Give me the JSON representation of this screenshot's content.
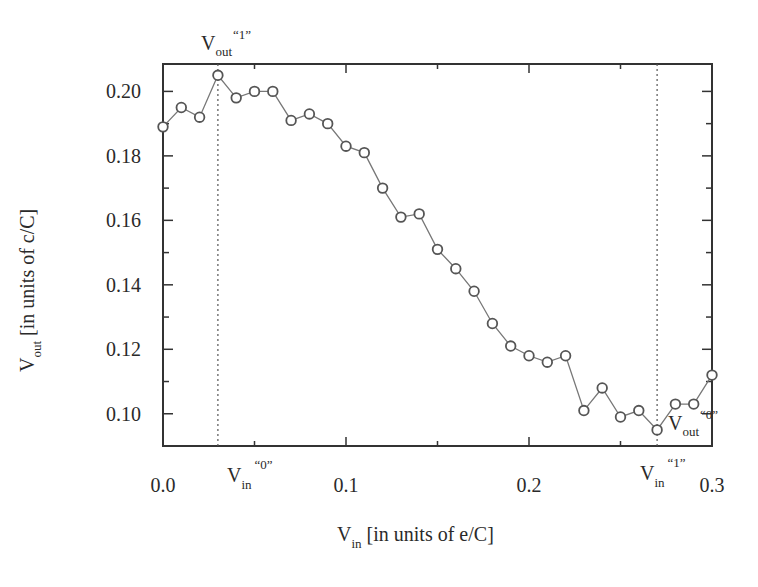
{
  "chart_data": {
    "type": "line",
    "title": "",
    "xlabel": "V_in [in units of e/C]",
    "ylabel": "V_out [in units of c/C]",
    "xlabel_parts": {
      "main": "V",
      "sub": "in",
      "rest": " [in units of e/C]"
    },
    "ylabel_parts": {
      "main": "V",
      "sub": "out",
      "rest": " [in units of c/C]"
    },
    "xlim": [
      0.0,
      0.3
    ],
    "ylim": [
      0.09,
      0.2085
    ],
    "x_ticks": [
      0.0,
      0.1,
      0.2,
      0.3
    ],
    "x_tick_labels": [
      "0.0",
      "0.1",
      "0.2",
      "0.3"
    ],
    "x_minor_ticks": [
      0.05,
      0.15,
      0.25
    ],
    "y_ticks": [
      0.1,
      0.12,
      0.14,
      0.16,
      0.18,
      0.2
    ],
    "y_tick_labels": [
      "0.10",
      "0.12",
      "0.14",
      "0.16",
      "0.18",
      "0.20"
    ],
    "y_minor_ticks": [
      0.11,
      0.13,
      0.15,
      0.17,
      0.19
    ],
    "grid": false,
    "legend": null,
    "marker": "open-circle",
    "line_color": "#777777",
    "marker_color": "#555555",
    "series": [
      {
        "name": "V_out vs V_in",
        "x": [
          0.0,
          0.01,
          0.02,
          0.03,
          0.04,
          0.05,
          0.06,
          0.07,
          0.08,
          0.09,
          0.1,
          0.11,
          0.12,
          0.13,
          0.14,
          0.15,
          0.16,
          0.17,
          0.18,
          0.19,
          0.2,
          0.21,
          0.22,
          0.23,
          0.24,
          0.25,
          0.26,
          0.27,
          0.28,
          0.29,
          0.3
        ],
        "values": [
          0.189,
          0.195,
          0.192,
          0.205,
          0.198,
          0.2,
          0.2,
          0.191,
          0.193,
          0.19,
          0.183,
          0.181,
          0.17,
          0.161,
          0.162,
          0.151,
          0.145,
          0.138,
          0.128,
          0.121,
          0.118,
          0.116,
          0.118,
          0.101,
          0.108,
          0.099,
          0.101,
          0.095,
          0.103,
          0.103,
          0.112
        ]
      }
    ],
    "reference_lines": [
      {
        "orientation": "vertical",
        "x": 0.03,
        "style": "dotted"
      },
      {
        "orientation": "vertical",
        "x": 0.27,
        "style": "dotted"
      }
    ],
    "annotations": [
      {
        "id": "vout1",
        "main": "V",
        "sub": "out",
        "sup": "“1”",
        "position": "above plot at x=0.03"
      },
      {
        "id": "vin0",
        "main": "V",
        "sub": "in",
        "sup": "“0”",
        "position": "below x-axis at x=0.03"
      },
      {
        "id": "vin1",
        "main": "V",
        "sub": "in",
        "sup": "“1”",
        "position": "below x-axis at x=0.27"
      },
      {
        "id": "vout0",
        "main": "V",
        "sub": "out",
        "sup": "“0”",
        "position": "inside plot near (0.27, 0.095)"
      }
    ]
  }
}
